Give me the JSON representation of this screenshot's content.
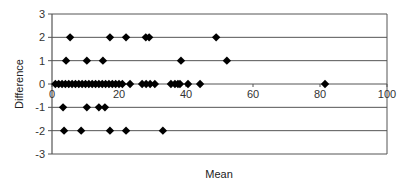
{
  "chart_data": {
    "type": "scatter",
    "title": "",
    "xlabel": "Mean",
    "ylabel": "Difference",
    "xlim": [
      0,
      100
    ],
    "ylim": [
      -3,
      3
    ],
    "xticks": [
      0,
      20,
      40,
      60,
      80,
      100
    ],
    "yticks": [
      -3,
      -2,
      -1,
      0,
      1,
      2,
      3
    ],
    "grid": "horizontal",
    "legend": null,
    "marker": "diamond",
    "series": [
      {
        "name": "Difference vs Mean",
        "points": [
          {
            "x": 5.4,
            "y": 2
          },
          {
            "x": 17.3,
            "y": 2
          },
          {
            "x": 22.1,
            "y": 2
          },
          {
            "x": 28,
            "y": 2
          },
          {
            "x": 29,
            "y": 2
          },
          {
            "x": 49,
            "y": 2
          },
          {
            "x": 4.2,
            "y": 1
          },
          {
            "x": 10.4,
            "y": 1
          },
          {
            "x": 15.2,
            "y": 1
          },
          {
            "x": 38.5,
            "y": 1
          },
          {
            "x": 52.2,
            "y": 1
          },
          {
            "x": 1,
            "y": 0
          },
          {
            "x": 2,
            "y": 0
          },
          {
            "x": 3,
            "y": 0
          },
          {
            "x": 4,
            "y": 0
          },
          {
            "x": 5,
            "y": 0
          },
          {
            "x": 6,
            "y": 0
          },
          {
            "x": 7,
            "y": 0
          },
          {
            "x": 8,
            "y": 0
          },
          {
            "x": 9,
            "y": 0
          },
          {
            "x": 10,
            "y": 0
          },
          {
            "x": 11,
            "y": 0
          },
          {
            "x": 12,
            "y": 0
          },
          {
            "x": 13,
            "y": 0
          },
          {
            "x": 14,
            "y": 0
          },
          {
            "x": 15,
            "y": 0
          },
          {
            "x": 16,
            "y": 0
          },
          {
            "x": 17,
            "y": 0
          },
          {
            "x": 18,
            "y": 0
          },
          {
            "x": 19,
            "y": 0
          },
          {
            "x": 20,
            "y": 0
          },
          {
            "x": 21,
            "y": 0
          },
          {
            "x": 23.3,
            "y": 0
          },
          {
            "x": 26.9,
            "y": 0
          },
          {
            "x": 28.1,
            "y": 0
          },
          {
            "x": 29.3,
            "y": 0
          },
          {
            "x": 30.7,
            "y": 0
          },
          {
            "x": 35.5,
            "y": 0
          },
          {
            "x": 36.7,
            "y": 0
          },
          {
            "x": 37.6,
            "y": 0
          },
          {
            "x": 38.2,
            "y": 0
          },
          {
            "x": 40.6,
            "y": 0
          },
          {
            "x": 44.2,
            "y": 0
          },
          {
            "x": 81.5,
            "y": 0
          },
          {
            "x": 3.3,
            "y": -1
          },
          {
            "x": 10.4,
            "y": -1
          },
          {
            "x": 14,
            "y": -1
          },
          {
            "x": 15.8,
            "y": -1
          },
          {
            "x": 3.6,
            "y": -2
          },
          {
            "x": 8.7,
            "y": -2
          },
          {
            "x": 17.3,
            "y": -2
          },
          {
            "x": 22.1,
            "y": -2
          },
          {
            "x": 33.1,
            "y": -2
          }
        ]
      }
    ]
  },
  "colors": {
    "marker": "#000000",
    "gridline": "#555555",
    "axis": "#555555",
    "text": "#333333"
  }
}
